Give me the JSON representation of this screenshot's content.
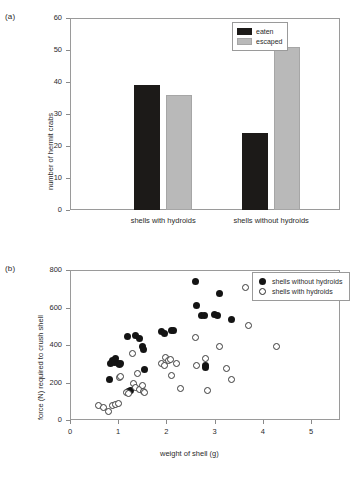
{
  "figure": {
    "panel_a_label": "(a)",
    "panel_b_label": "(b)"
  },
  "colors": {
    "eaten": "#1c1a18",
    "escaped": "#b9b9b9",
    "filled_marker": "#141414",
    "open_marker": "#ffffff",
    "axis": "#8a8a8a"
  },
  "chart_data": [
    {
      "type": "bar",
      "title": "",
      "panel": "(a)",
      "xlabel": "",
      "ylabel": "number of hermit crabs",
      "categories": [
        "shells with hydroids",
        "shells without hydroids"
      ],
      "ylim": [
        0,
        60
      ],
      "yticks": [
        0,
        10,
        20,
        30,
        40,
        50,
        60
      ],
      "ytick_labels": [
        "0",
        "10",
        "20",
        "30",
        "40",
        "50",
        "60"
      ],
      "grid": false,
      "legend_position": "top-right",
      "series": [
        {
          "name": "eaten",
          "values": [
            39,
            24
          ],
          "color": "#1c1a18"
        },
        {
          "name": "escaped",
          "values": [
            36,
            51
          ],
          "color": "#b9b9b9"
        }
      ]
    },
    {
      "type": "scatter",
      "title": "",
      "panel": "(b)",
      "xlabel": "weight of shell (g)",
      "ylabel": "force (N) required to crush shell",
      "xlim": [
        0,
        5.6
      ],
      "ylim": [
        0,
        800
      ],
      "xticks": [
        0,
        1,
        2,
        3,
        4,
        5
      ],
      "xtick_labels": [
        "0",
        "1",
        "2",
        "3",
        "4",
        "5"
      ],
      "yticks": [
        0,
        200,
        400,
        600,
        800
      ],
      "ytick_labels": [
        "0",
        "200",
        "400",
        "600",
        "800"
      ],
      "grid": false,
      "legend_position": "top-right",
      "series": [
        {
          "name": "shells without hydroids",
          "marker": "filled",
          "points": [
            [
              0.82,
              215
            ],
            [
              0.85,
              300
            ],
            [
              0.88,
              320
            ],
            [
              0.92,
              305
            ],
            [
              0.95,
              330
            ],
            [
              1.0,
              300
            ],
            [
              1.02,
              295
            ],
            [
              1.05,
              300
            ],
            [
              1.2,
              445
            ],
            [
              1.22,
              150
            ],
            [
              1.25,
              160
            ],
            [
              1.35,
              450
            ],
            [
              1.45,
              435
            ],
            [
              1.5,
              390
            ],
            [
              1.52,
              375
            ],
            [
              1.55,
              270
            ],
            [
              1.9,
              470
            ],
            [
              1.95,
              460
            ],
            [
              2.1,
              480
            ],
            [
              2.15,
              475
            ],
            [
              2.6,
              740
            ],
            [
              2.62,
              610
            ],
            [
              2.72,
              555
            ],
            [
              2.78,
              560
            ],
            [
              2.8,
              290
            ],
            [
              2.82,
              280
            ],
            [
              3.0,
              565
            ],
            [
              3.05,
              560
            ],
            [
              3.1,
              675
            ],
            [
              3.35,
              535
            ]
          ]
        },
        {
          "name": "shells with hydroids",
          "marker": "open",
          "points": [
            [
              0.6,
              75
            ],
            [
              0.7,
              65
            ],
            [
              0.8,
              45
            ],
            [
              0.88,
              75
            ],
            [
              0.95,
              85
            ],
            [
              1.0,
              90
            ],
            [
              1.02,
              225
            ],
            [
              1.05,
              230
            ],
            [
              1.18,
              145
            ],
            [
              1.22,
              140
            ],
            [
              1.3,
              355
            ],
            [
              1.32,
              195
            ],
            [
              1.35,
              175
            ],
            [
              1.4,
              250
            ],
            [
              1.45,
              165
            ],
            [
              1.5,
              185
            ],
            [
              1.52,
              150
            ],
            [
              1.55,
              145
            ],
            [
              1.9,
              300
            ],
            [
              1.95,
              290
            ],
            [
              1.98,
              335
            ],
            [
              2.05,
              320
            ],
            [
              2.08,
              325
            ],
            [
              2.1,
              235
            ],
            [
              2.2,
              300
            ],
            [
              2.3,
              170
            ],
            [
              2.6,
              440
            ],
            [
              2.62,
              290
            ],
            [
              2.8,
              330
            ],
            [
              2.85,
              160
            ],
            [
              3.1,
              390
            ],
            [
              3.25,
              275
            ],
            [
              3.35,
              215
            ],
            [
              3.65,
              705
            ],
            [
              3.7,
              505
            ],
            [
              4.28,
              390
            ]
          ]
        }
      ]
    }
  ]
}
